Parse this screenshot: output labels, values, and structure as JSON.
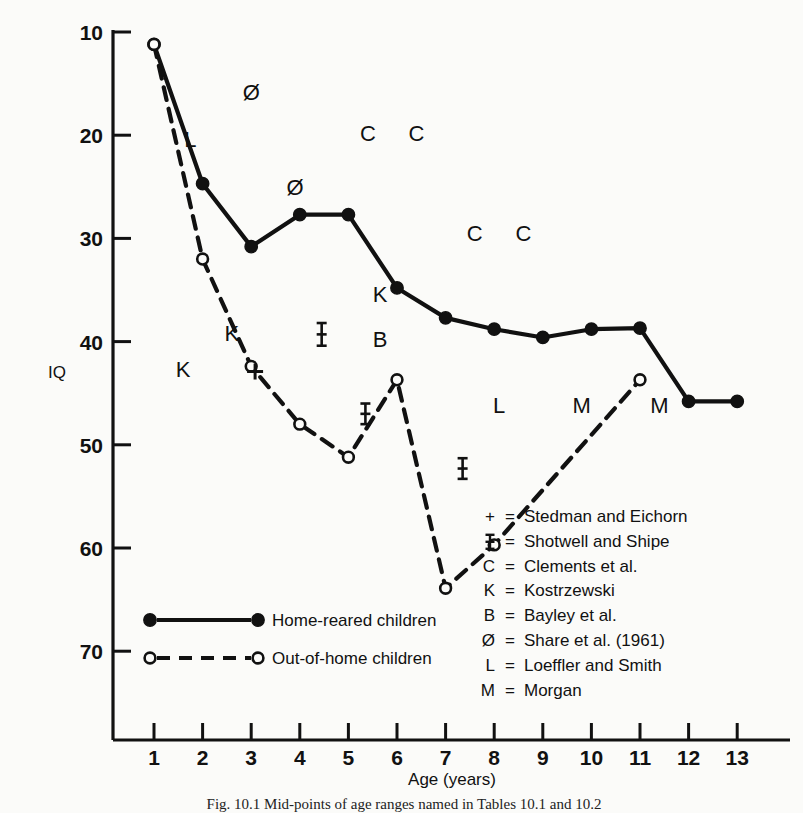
{
  "chart_data": {
    "type": "line",
    "title": "",
    "xlabel": "Age (years)",
    "ylabel": "IQ",
    "xlim": [
      0.4,
      13.6
    ],
    "ylim": [
      0,
      72
    ],
    "xticks": [
      1,
      2,
      3,
      4,
      5,
      6,
      7,
      8,
      9,
      10,
      11,
      12,
      13
    ],
    "yticks": [
      10,
      20,
      30,
      40,
      50,
      60,
      70
    ],
    "grid": false,
    "legend_position": "inside-bottom-left",
    "series": [
      {
        "name": "Home-reared children",
        "marker": "filled-circle",
        "linestyle": "solid",
        "x": [
          1,
          2,
          3,
          4,
          5,
          6,
          7,
          8,
          9,
          10,
          11,
          12,
          13
        ],
        "values": [
          68.8,
          55.3,
          49.2,
          52.3,
          52.3,
          45.2,
          42.3,
          41.2,
          40.4,
          41.2,
          41.3,
          34.2,
          34.2
        ]
      },
      {
        "name": "Out-of-home children",
        "marker": "open-circle",
        "linestyle": "dashed",
        "x": [
          1,
          2,
          3,
          4,
          5,
          6,
          7,
          8,
          11
        ],
        "values": [
          68.8,
          48.0,
          37.6,
          32.0,
          28.8,
          36.3,
          16.1,
          20.3,
          36.3
        ]
      }
    ],
    "annotations": [
      {
        "label": "Ø",
        "x": 3.0,
        "y": 64.2
      },
      {
        "label": "L",
        "x": 1.75,
        "y": 59.6
      },
      {
        "label": "C",
        "x": 5.4,
        "y": 60.2
      },
      {
        "label": "C",
        "x": 6.4,
        "y": 60.2
      },
      {
        "label": "Ø",
        "x": 3.9,
        "y": 55.0
      },
      {
        "label": "C",
        "x": 7.6,
        "y": 50.5
      },
      {
        "label": "C",
        "x": 8.6,
        "y": 50.5
      },
      {
        "label": "K",
        "x": 5.65,
        "y": 44.6
      },
      {
        "label": "K",
        "x": 2.6,
        "y": 40.8
      },
      {
        "label": "B",
        "x": 5.65,
        "y": 40.3
      },
      {
        "label": "K",
        "x": 1.6,
        "y": 37.3
      },
      {
        "label": "L",
        "x": 8.1,
        "y": 33.9
      },
      {
        "label": "M",
        "x": 9.8,
        "y": 33.9
      },
      {
        "label": "M",
        "x": 11.4,
        "y": 33.9
      }
    ],
    "error_bars": [
      {
        "x": 4.45,
        "y": 40.7,
        "err": 1.1
      },
      {
        "x": 5.35,
        "y": 33.0,
        "err": 1.0
      },
      {
        "x": 7.35,
        "y": 27.7,
        "err": 1.0
      }
    ],
    "plus_markers": [
      {
        "x": 3.08,
        "y": 37.1
      }
    ]
  },
  "axis": {
    "y_label": "IQ",
    "x_label": "Age (years)",
    "x_tick_labels": [
      "1",
      "2",
      "3",
      "4",
      "5",
      "6",
      "7",
      "8",
      "9",
      "10",
      "11",
      "12",
      "13"
    ],
    "y_tick_labels": [
      "70",
      "60",
      "50",
      "40",
      "30",
      "20",
      "10"
    ]
  },
  "series_legend": {
    "items": [
      {
        "symbol": "filled-circle",
        "style": "solid",
        "label": "Home-reared children"
      },
      {
        "symbol": "open-circle",
        "style": "dashed",
        "label": "Out-of-home children"
      }
    ]
  },
  "symbol_key": {
    "entries": [
      {
        "symbol": "+",
        "equals": "=",
        "label": "Stedman and Eichorn"
      },
      {
        "symbol": "‡",
        "equals": "=",
        "label": "Shotwell and Shipe"
      },
      {
        "symbol": "C",
        "equals": "=",
        "label": "Clements et al."
      },
      {
        "symbol": "K",
        "equals": "=",
        "label": "Kostrzewski"
      },
      {
        "symbol": "B",
        "equals": "=",
        "label": "Bayley et al."
      },
      {
        "symbol": "Ø",
        "equals": "=",
        "label": "Share et al. (1961)"
      },
      {
        "symbol": "L",
        "equals": "=",
        "label": "Loeffler and Smith"
      },
      {
        "symbol": "M",
        "equals": "=",
        "label": "Morgan"
      }
    ]
  },
  "caption": {
    "text": "Fig. 10.1 Mid-points of age ranges named in Tables 10.1 and 10.2"
  },
  "colors": {
    "ink": "#111111",
    "background": "#fbfbf9"
  }
}
